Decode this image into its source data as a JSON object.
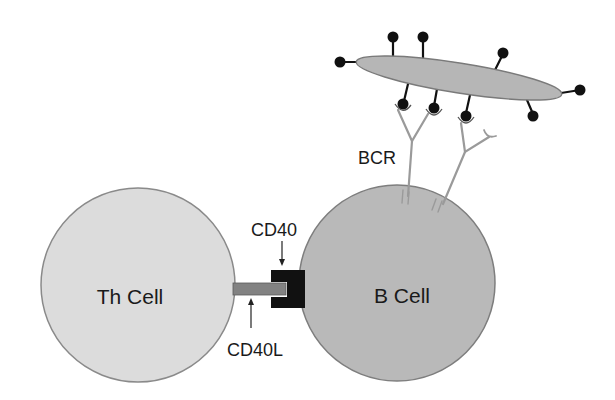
{
  "diagram": {
    "th_cell": {
      "label": "Th Cell",
      "fill": "#dcdcdc",
      "stroke": "#8a8a8a"
    },
    "b_cell": {
      "label": "B Cell",
      "fill": "#b9b9b9",
      "stroke": "#7e7e7e"
    },
    "antigen": {
      "fill": "#b6b6b6",
      "stroke": "#7a7a7a",
      "epitope_color": "#111111"
    },
    "receptors": {
      "bcr_label": "BCR",
      "cd40_label": "CD40",
      "cd40l_label": "CD40L",
      "bcr_color": "#9a9a9a",
      "cd40_color": "#111111",
      "cd40l_color": "#828282"
    }
  }
}
